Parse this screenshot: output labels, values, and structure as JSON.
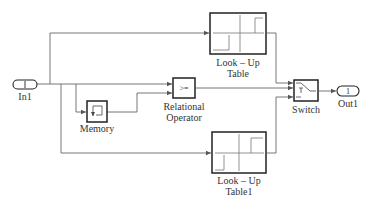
{
  "diagram": {
    "type": "simulink-block-diagram",
    "colors": {
      "line": "#555555",
      "block": "#222222",
      "text": "#333333",
      "background": "#ffffff"
    },
    "blocks": {
      "in1": {
        "port_number": "1",
        "label": "In1"
      },
      "lookup_table": {
        "label_line1": "Look – Up",
        "label_line2": "Table"
      },
      "lookup_table1": {
        "label_line1": "Look – Up",
        "label_line2": "Table1"
      },
      "memory": {
        "label": "Memory"
      },
      "relational_operator": {
        "operator": ">=",
        "label_line1": "Relational",
        "label_line2": "Operator"
      },
      "switch": {
        "label": "Switch"
      },
      "out1": {
        "port_number": "1",
        "label": "Out1"
      }
    },
    "connections": [
      {
        "from": "In1",
        "to": "Look-Up Table"
      },
      {
        "from": "In1",
        "to": "Relational Operator (input 1)"
      },
      {
        "from": "In1",
        "to": "Memory"
      },
      {
        "from": "In1",
        "to": "Look-Up Table1"
      },
      {
        "from": "Memory",
        "to": "Relational Operator (input 2)"
      },
      {
        "from": "Look-Up Table",
        "to": "Switch (input 1)"
      },
      {
        "from": "Relational Operator",
        "to": "Switch (input 2, control)"
      },
      {
        "from": "Look-Up Table1",
        "to": "Switch (input 3)"
      },
      {
        "from": "Switch",
        "to": "Out1"
      }
    ]
  }
}
